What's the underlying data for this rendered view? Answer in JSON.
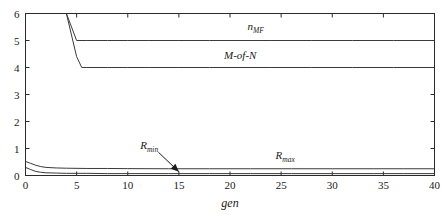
{
  "chart_data": {
    "type": "line",
    "title": "",
    "xlabel": "gen",
    "ylabel": "",
    "xlim": [
      0,
      40
    ],
    "ylim": [
      0,
      6
    ],
    "grid": false,
    "legend_position": "inline-annotations",
    "xticks": [
      0,
      5,
      10,
      15,
      20,
      25,
      30,
      35,
      40
    ],
    "xtick_labels": [
      "0",
      "5",
      "10",
      "15",
      "20",
      "25",
      "30",
      "35",
      "40"
    ],
    "yticks": [
      0,
      1,
      2,
      3,
      4,
      5,
      6
    ],
    "ytick_labels": [
      "0",
      "1",
      "2",
      "3",
      "4",
      "5",
      "6"
    ],
    "series": [
      {
        "name": "n_MF",
        "label_text": "n",
        "label_subscript": "MF",
        "label_x": 22.5,
        "label_y": 5.38,
        "x": [
          0,
          1,
          2,
          3,
          4,
          5,
          6,
          8,
          10,
          12,
          15,
          18,
          20,
          24,
          28,
          32,
          36,
          40
        ],
        "y": [
          6,
          6,
          6,
          6,
          6,
          5,
          5,
          5,
          5,
          5,
          5,
          5,
          5,
          5,
          5,
          5,
          5,
          5
        ]
      },
      {
        "name": "M-of-N",
        "label_text": "M-of-N",
        "label_subscript": "",
        "label_x": 21.0,
        "label_y": 4.32,
        "x": [
          0,
          1,
          2,
          3,
          4,
          5,
          5.5,
          6,
          8,
          10,
          12,
          15,
          18,
          20,
          24,
          28,
          32,
          36,
          40
        ],
        "y": [
          6,
          6,
          6,
          6,
          6,
          4.4,
          4,
          4,
          4,
          4,
          4,
          4,
          4,
          4,
          4,
          4,
          4,
          4,
          4
        ]
      },
      {
        "name": "R_max",
        "label_text": "R",
        "label_subscript": "max",
        "label_x": 25.4,
        "label_y": 0.62,
        "x": [
          0,
          0.5,
          1,
          1.5,
          2,
          3,
          4,
          6,
          8,
          10,
          14,
          18,
          22,
          26,
          30,
          34,
          37,
          40
        ],
        "y": [
          0.52,
          0.45,
          0.38,
          0.33,
          0.3,
          0.28,
          0.27,
          0.26,
          0.26,
          0.255,
          0.25,
          0.25,
          0.25,
          0.25,
          0.25,
          0.25,
          0.25,
          0.25
        ]
      },
      {
        "name": "R_min",
        "label_text": "R",
        "label_subscript": "min",
        "label_x": 12.1,
        "label_y": 0.98,
        "x": [
          0,
          0.5,
          1,
          1.5,
          2,
          3,
          4,
          6,
          8,
          10,
          14,
          18,
          22,
          26,
          30,
          34,
          37,
          40
        ],
        "y": [
          0.3,
          0.22,
          0.15,
          0.12,
          0.1,
          0.09,
          0.08,
          0.08,
          0.07,
          0.07,
          0.07,
          0.07,
          0.07,
          0.07,
          0.07,
          0.07,
          0.07,
          0.07
        ]
      }
    ],
    "annotations": [
      {
        "name": "rmin-arrow",
        "target_x": 15.0,
        "target_y": 0.14,
        "start_x": 13.0,
        "start_y": 0.86
      }
    ]
  },
  "colors": {
    "line": "#3a3a3a",
    "axis": "#2b2b2b",
    "text": "#1a1a1a",
    "background": "#ffffff"
  }
}
